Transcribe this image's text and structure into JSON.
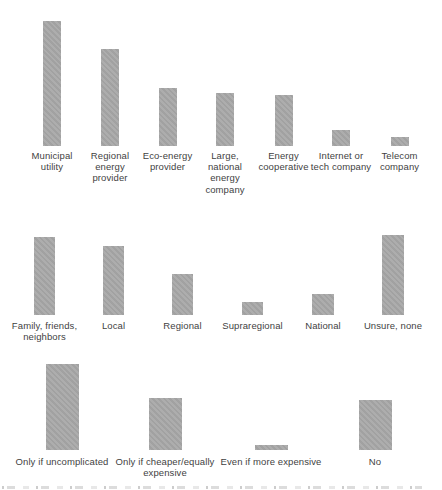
{
  "figure": {
    "background_color": "#ffffff",
    "bar_fill_color": "#a8a8a8",
    "label_text_color": "#3f3f3f",
    "axes_visible": false,
    "value_labels_visible": false,
    "note": "Three stacked single-series bar charts, no numeric axes; bar magnitudes estimated in pixels from the image. A cut-off, illegible caption line is clipped at the bottom edge."
  },
  "chart_data": [
    {
      "type": "bar",
      "title": "",
      "xlabel": "",
      "ylabel": "",
      "legend": null,
      "grid": false,
      "categories": [
        "Municipal utility",
        "Regional energy provider",
        "Eco-energy provider",
        "Large, national energy company",
        "Energy cooperative",
        "Internet or tech company",
        "Telecom company"
      ],
      "label_lines": [
        [
          "Municipal",
          "utility"
        ],
        [
          "Regional",
          "energy",
          "provider"
        ],
        [
          "Eco-energy",
          "provider"
        ],
        [
          "Large,",
          "national",
          "energy",
          "company"
        ],
        [
          "Energy",
          "cooperative"
        ],
        [
          "Internet or",
          "tech company"
        ],
        [
          "Telecom",
          "company"
        ]
      ],
      "values_px_height": [
        125,
        97,
        58,
        53,
        51,
        16,
        9
      ],
      "values_relative_to_max": [
        1.0,
        0.78,
        0.46,
        0.42,
        0.41,
        0.13,
        0.07
      ]
    },
    {
      "type": "bar",
      "title": "",
      "xlabel": "",
      "ylabel": "",
      "legend": null,
      "grid": false,
      "categories": [
        "Family, friends, neighbors",
        "Local",
        "Regional",
        "Supraregional",
        "National",
        "Unsure, none"
      ],
      "label_lines": [
        [
          "Family, friends,",
          "neighbors"
        ],
        [
          "Local"
        ],
        [
          "Regional"
        ],
        [
          "Supraregional"
        ],
        [
          "National"
        ],
        [
          "Unsure, none"
        ]
      ],
      "values_px_height": [
        78,
        69,
        41,
        13,
        21,
        80
      ],
      "values_relative_to_max": [
        0.98,
        0.86,
        0.51,
        0.16,
        0.26,
        1.0
      ]
    },
    {
      "type": "bar",
      "title": "",
      "xlabel": "",
      "ylabel": "",
      "legend": null,
      "grid": false,
      "categories": [
        "Only if uncomplicated",
        "Only if cheaper/equally expensive",
        "Even if more expensive",
        "No"
      ],
      "label_lines": [
        [
          "Only if uncomplicated"
        ],
        [
          "Only if cheaper/equally",
          "expensive"
        ],
        [
          "Even if more expensive"
        ],
        [
          "No"
        ]
      ],
      "values_px_height": [
        86,
        52,
        5,
        50
      ],
      "values_relative_to_max": [
        1.0,
        0.6,
        0.06,
        0.58
      ]
    }
  ]
}
